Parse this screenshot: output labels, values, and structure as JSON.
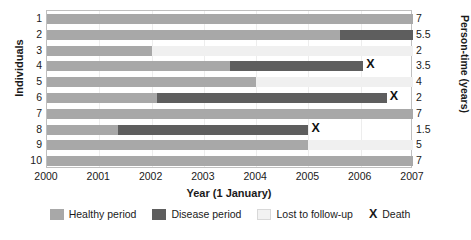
{
  "chart_data": {
    "type": "bar",
    "title": "",
    "subtitle": "",
    "xlabel": "Year (1 January)",
    "ylabel": "Individuals",
    "ylabel_right": "Person-time (years)",
    "xlim": [
      2000,
      2007
    ],
    "xticks": [
      "2000",
      "2001",
      "2002",
      "2003",
      "2004",
      "2005",
      "2006",
      "2007"
    ],
    "grid": false,
    "legend_position": "bottom",
    "legend": [
      {
        "key": "healthy",
        "label": "Healthy period",
        "color": "#a8a8a8"
      },
      {
        "key": "disease",
        "label": "Disease period",
        "color": "#5e5e5e"
      },
      {
        "key": "lost",
        "label": "Lost to follow-up",
        "color": "#f2f2f2"
      },
      {
        "key": "death",
        "label": "Death",
        "marker": "X"
      }
    ],
    "categories": [
      "1",
      "2",
      "3",
      "4",
      "5",
      "6",
      "7",
      "8",
      "9",
      "10"
    ],
    "person_time_label": "Person-time (years)",
    "values": [
      7,
      5.5,
      2,
      3.5,
      4,
      2,
      7,
      1.5,
      5,
      7
    ],
    "rows": [
      {
        "individual": "1",
        "person_time": "7",
        "segments": [
          {
            "type": "healthy",
            "start": 2000,
            "end": 2007
          }
        ],
        "death": null
      },
      {
        "individual": "2",
        "person_time": "5.5",
        "segments": [
          {
            "type": "healthy",
            "start": 2000,
            "end": 2005.6
          },
          {
            "type": "disease",
            "start": 2005.6,
            "end": 2007
          }
        ],
        "death": null
      },
      {
        "individual": "3",
        "person_time": "2",
        "segments": [
          {
            "type": "healthy",
            "start": 2000,
            "end": 2002
          },
          {
            "type": "lost",
            "start": 2002,
            "end": 2007
          }
        ],
        "death": null
      },
      {
        "individual": "4",
        "person_time": "3.5",
        "segments": [
          {
            "type": "healthy",
            "start": 2000,
            "end": 2003.5
          },
          {
            "type": "disease",
            "start": 2003.5,
            "end": 2006.05
          }
        ],
        "death": 2006.05
      },
      {
        "individual": "5",
        "person_time": "4",
        "segments": [
          {
            "type": "healthy",
            "start": 2000,
            "end": 2004
          },
          {
            "type": "lost",
            "start": 2004,
            "end": 2007
          }
        ],
        "death": null
      },
      {
        "individual": "6",
        "person_time": "2",
        "segments": [
          {
            "type": "healthy",
            "start": 2000,
            "end": 2002.1
          },
          {
            "type": "disease",
            "start": 2002.1,
            "end": 2006.5
          }
        ],
        "death": 2006.5
      },
      {
        "individual": "7",
        "person_time": "7",
        "segments": [
          {
            "type": "healthy",
            "start": 2000,
            "end": 2007
          }
        ],
        "death": null
      },
      {
        "individual": "8",
        "person_time": "1.5",
        "segments": [
          {
            "type": "healthy",
            "start": 2000,
            "end": 2001.35
          },
          {
            "type": "disease",
            "start": 2001.35,
            "end": 2005.0
          }
        ],
        "death": 2005.0
      },
      {
        "individual": "9",
        "person_time": "5",
        "segments": [
          {
            "type": "healthy",
            "start": 2000,
            "end": 2005.0
          },
          {
            "type": "lost",
            "start": 2005.0,
            "end": 2007
          }
        ],
        "death": null
      },
      {
        "individual": "10",
        "person_time": "7",
        "segments": [
          {
            "type": "healthy",
            "start": 2000,
            "end": 2007
          }
        ],
        "death": null
      }
    ]
  }
}
